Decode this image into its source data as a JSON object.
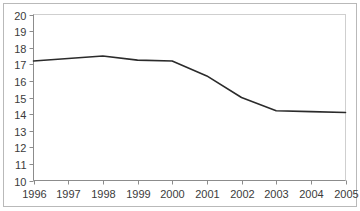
{
  "chart_data": {
    "type": "line",
    "title": "",
    "subtitle": "",
    "xlabel": "",
    "ylabel": "",
    "x": [
      1996,
      1997,
      1998,
      1999,
      2000,
      2001,
      2002,
      2003,
      2004,
      2005
    ],
    "categories": [
      "1996",
      "1997",
      "1998",
      "1999",
      "2000",
      "2001",
      "2002",
      "2003",
      "2004",
      "2005"
    ],
    "values": [
      17.2,
      17.35,
      17.5,
      17.25,
      17.2,
      16.3,
      15.0,
      14.2,
      14.15,
      14.1
    ],
    "series": [
      {
        "name": "",
        "values": [
          17.2,
          17.35,
          17.5,
          17.25,
          17.2,
          16.3,
          15.0,
          14.2,
          14.15,
          14.1
        ]
      }
    ],
    "xlim": [
      1996,
      2005
    ],
    "ylim": [
      10,
      20
    ],
    "yticks": [
      10,
      11,
      12,
      13,
      14,
      15,
      16,
      17,
      18,
      19,
      20
    ],
    "ytick_labels": [
      "10",
      "11",
      "12",
      "13",
      "14",
      "15",
      "16",
      "17",
      "18",
      "19",
      "20"
    ],
    "xticks": [
      1996,
      1997,
      1998,
      1999,
      2000,
      2001,
      2002,
      2003,
      2004,
      2005
    ],
    "xtick_labels": [
      "1996",
      "1997",
      "1998",
      "1999",
      "2000",
      "2001",
      "2002",
      "2003",
      "2004",
      "2005"
    ],
    "grid": false,
    "legend": false,
    "legend_position": "none",
    "annotations": [],
    "colors": {
      "line": "#2b2b2b",
      "axis": "#8c8c8c",
      "plot_border": "#cfcfcf",
      "outer_frame": "#b9b9b9",
      "background": "#ffffff",
      "tick_label": "#3b3b3b"
    }
  }
}
